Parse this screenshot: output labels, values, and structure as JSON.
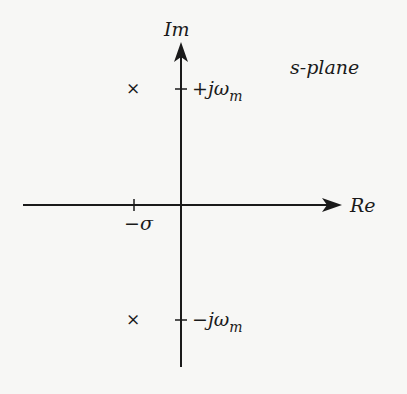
{
  "diagram": {
    "title": "s-plane",
    "axes": {
      "real_label": "Re",
      "imag_label": "Im"
    },
    "ticks": {
      "real": {
        "label": "−σ"
      },
      "imag_pos": {
        "prefix": "+jω",
        "sub": "m"
      },
      "imag_neg": {
        "prefix": "−jω",
        "sub": "m"
      }
    },
    "poles": [
      {
        "symbol": "×",
        "re": "-σ",
        "im": "+jωm"
      },
      {
        "symbol": "×",
        "re": "-σ",
        "im": "-jωm"
      }
    ]
  }
}
